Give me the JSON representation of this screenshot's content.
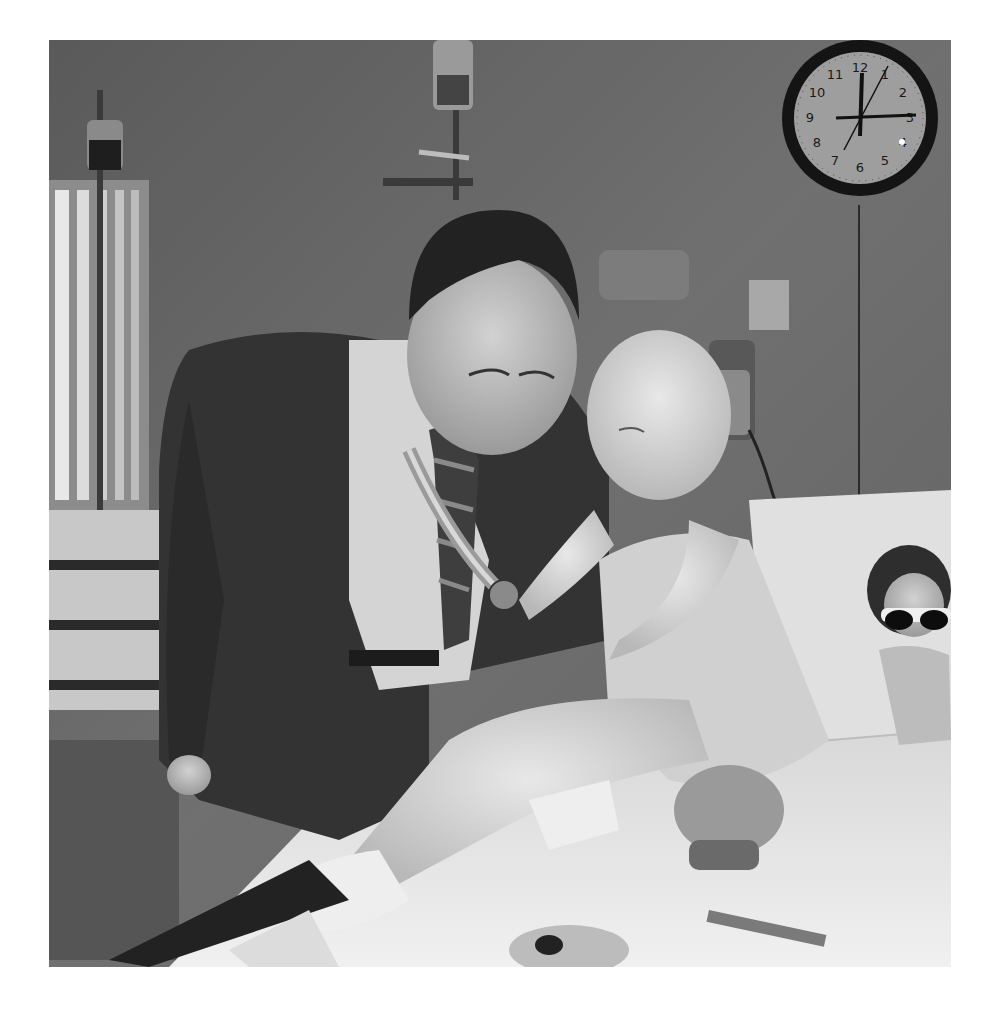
{
  "photo": {
    "alt": "Black-and-white photograph: a man in a suit and tie shows a medal on a striped ribbon to a young bald girl sitting on a hospital bed; a wall clock, IV pole, and a doll wearing sunglasses are in the room.",
    "style": "black-and-white"
  },
  "clock": {
    "numerals": [
      "12",
      "1",
      "2",
      "3",
      "4",
      "5",
      "6",
      "7",
      "8",
      "9",
      "10",
      "11"
    ],
    "hour_hand": "12",
    "minute_hand": "3",
    "second_hand": "7"
  },
  "colors": {
    "frame": "#ffffff",
    "wall": "#6a6a6a",
    "bed_sheet": "#e6e6e6",
    "suit": "#333333"
  }
}
